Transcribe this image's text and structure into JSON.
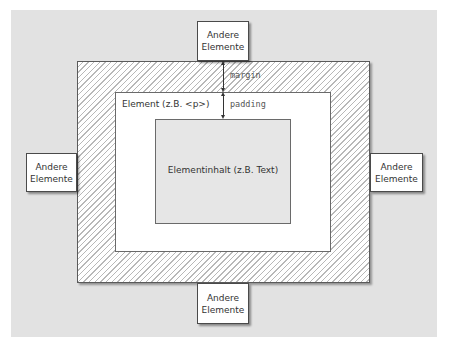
{
  "diagram": {
    "neighbors": {
      "top": {
        "line1": "Andere",
        "line2": "Elemente"
      },
      "left": {
        "line1": "Andere",
        "line2": "Elemente"
      },
      "right": {
        "line1": "Andere",
        "line2": "Elemente"
      },
      "bottom": {
        "line1": "Andere",
        "line2": "Elemente"
      }
    },
    "element_label": "Element (z.B. <p>)",
    "content_label": "Elementinhalt (z.B. Text)",
    "margin_label": "margin",
    "padding_label": "padding",
    "colors": {
      "background": "#e2e2e2",
      "margin_hatch": "#b8b8b8",
      "element": "#ffffff",
      "content": "#e6e6e6",
      "border": "#5a5a5a"
    }
  }
}
